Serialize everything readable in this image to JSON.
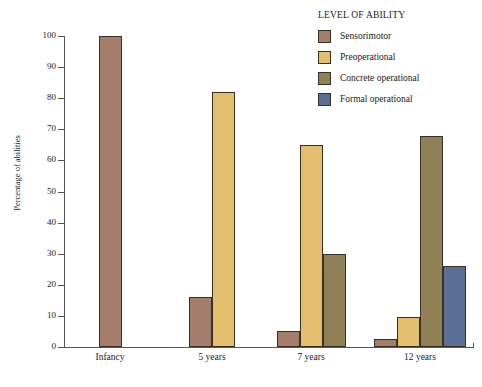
{
  "legend": {
    "title": "LEVEL OF ABILITY",
    "items": [
      {
        "label": "Sensorimotor",
        "color": "#a57d6d"
      },
      {
        "label": "Preoperational",
        "color": "#e3bf6d"
      },
      {
        "label": "Concrete operational",
        "color": "#8f8055"
      },
      {
        "label": "Formal operational",
        "color": "#5a6e96"
      }
    ]
  },
  "chart_data": {
    "type": "bar",
    "title": "",
    "xlabel": "",
    "ylabel": "Percentage of abilities",
    "categories": [
      "Infancy",
      "5 years",
      "7 years",
      "12 years"
    ],
    "ylim": [
      0,
      100
    ],
    "yticks": [
      0,
      10,
      20,
      30,
      40,
      50,
      60,
      70,
      80,
      90,
      100
    ],
    "ytick_labels": [
      "0",
      "10",
      "20",
      "30",
      "40",
      "50",
      "60",
      "70",
      "80",
      "90",
      "100"
    ],
    "grid": false,
    "legend_position": "top-right",
    "series": [
      {
        "name": "Sensorimotor",
        "color": "#a57d6d",
        "values": [
          100,
          16,
          5,
          2.5
        ]
      },
      {
        "name": "Preoperational",
        "color": "#e3bf6d",
        "values": [
          null,
          82,
          65,
          9.5
        ]
      },
      {
        "name": "Concrete operational",
        "color": "#8f8055",
        "values": [
          null,
          null,
          30,
          68
        ]
      },
      {
        "name": "Formal operational",
        "color": "#5a6e96",
        "values": [
          null,
          null,
          null,
          26
        ]
      }
    ]
  }
}
